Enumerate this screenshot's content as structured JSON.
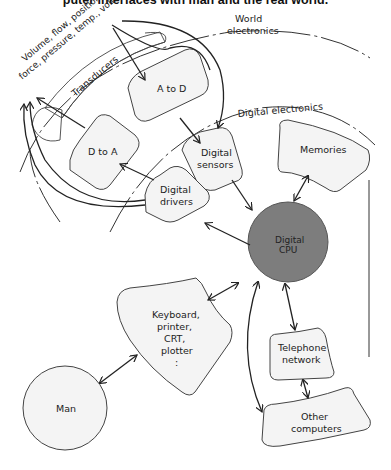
{
  "caption": "puter interfaces with man and the real world.",
  "regions": {
    "world": [
      "World",
      "electronics"
    ],
    "digital": "Digital electronics",
    "transducers": "Transducers",
    "quantities": [
      "Volume, flow, position,",
      "force, pressure, temp., voltage"
    ]
  },
  "nodes": {
    "a_to_d": "A to D",
    "d_to_a": "D to A",
    "digital_sensors": [
      "Digital",
      "sensors"
    ],
    "digital_drivers": [
      "Digital",
      "drivers"
    ],
    "memories": "Memories",
    "cpu": [
      "Digital",
      "CPU"
    ],
    "peripherals": [
      "Keyboard,",
      "printer,",
      "CRT,",
      "plotter",
      ":"
    ],
    "telephone": [
      "Telephone",
      "network"
    ],
    "other_computers": [
      "Other",
      "computers"
    ],
    "man": "Man"
  },
  "colors": {
    "cpu_fill": "#7d7d7d",
    "node_fill": "#f4f4f4"
  }
}
